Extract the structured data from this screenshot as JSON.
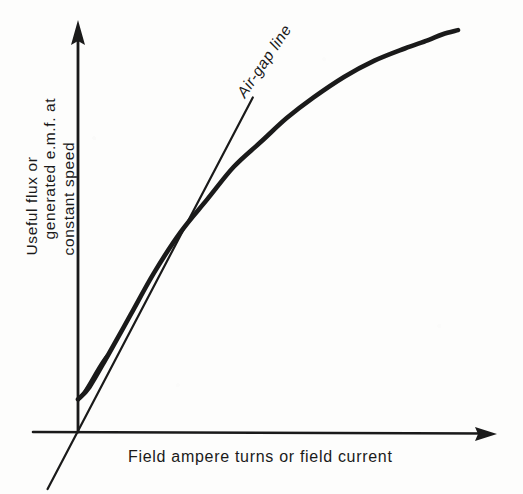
{
  "figure": {
    "background_color": "#fdfdfc",
    "ink_color": "#1a1a1a"
  },
  "labels": {
    "ylabel_line1": "Useful flux or",
    "ylabel_line2": "generated e.m.f. at",
    "ylabel_line3": "constant speed",
    "ylabel_full": "Useful flux or generated e.m.f. at constant speed",
    "xlabel": "Field ampere turns or field current",
    "airgap_line_label": "Air-gap line"
  },
  "chart_data": {
    "type": "line",
    "title": "",
    "subtitle": "",
    "xlabel": "Field ampere turns or field current",
    "ylabel": "Useful flux or generated e.m.f. at constant speed",
    "xlim": [
      0,
      100
    ],
    "ylim": [
      0,
      100
    ],
    "grid": false,
    "legend": "none",
    "axis_ticks": "none",
    "axis_arrows": {
      "x_axis_arrow": "right",
      "y_axis_arrow": "up"
    },
    "annotations": [
      {
        "text": "Air-gap line",
        "x": 46,
        "y": 86,
        "rotation_deg": -56,
        "style": "italic"
      }
    ],
    "series": [
      {
        "name": "Magnetization (open-circuit) characteristic",
        "style": "solid-thick",
        "note": "Saturation curve; starts at small residual value on the y-axis, linear at first then bends over at the knee",
        "x": [
          0,
          3,
          8,
          14,
          20,
          27,
          34,
          41,
          48,
          55,
          62,
          70,
          78,
          86,
          92,
          96,
          100
        ],
        "y": [
          8,
          11,
          19,
          29,
          39,
          49,
          57,
          65,
          71,
          77,
          82,
          87,
          91,
          94,
          96,
          97.5,
          98.5
        ]
      },
      {
        "name": "Air-gap line",
        "style": "solid-thin",
        "note": "Straight tangent to the initial linear part of the curve, passing through the origin and extended below it",
        "x": [
          -8,
          0,
          29,
          46
        ],
        "y": [
          -14,
          0,
          52,
          82
        ]
      }
    ],
    "features": {
      "residual_flux_on_y_axis": 8,
      "tangency_end_x": 29,
      "knee_region_x": [
        34,
        55
      ],
      "saturation_region_x": [
        70,
        100
      ]
    }
  }
}
